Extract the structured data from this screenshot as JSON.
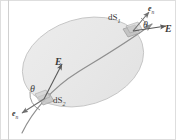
{
  "figure": {
    "background_color": "#ffffff",
    "surface": {
      "name": "gaussian-surface-ellipse",
      "fill_color": "#e9e9e9",
      "stroke_color": "#c9c9c9"
    },
    "field_line": {
      "name": "electric-field-line",
      "stroke_color": "#8c8c8c"
    },
    "border_color": "#d6d6d6",
    "labels": {
      "dS1": {
        "text": "dS",
        "subscript": "1"
      },
      "dS2": {
        "text": "dS",
        "subscript": "2"
      },
      "E_right": "E",
      "E_middle": "E",
      "en_top": {
        "text": "e",
        "subscript": "n"
      },
      "en_bottom": {
        "text": "e",
        "subscript": "n"
      },
      "theta_top": "θ",
      "theta_bottom": "θ"
    }
  }
}
